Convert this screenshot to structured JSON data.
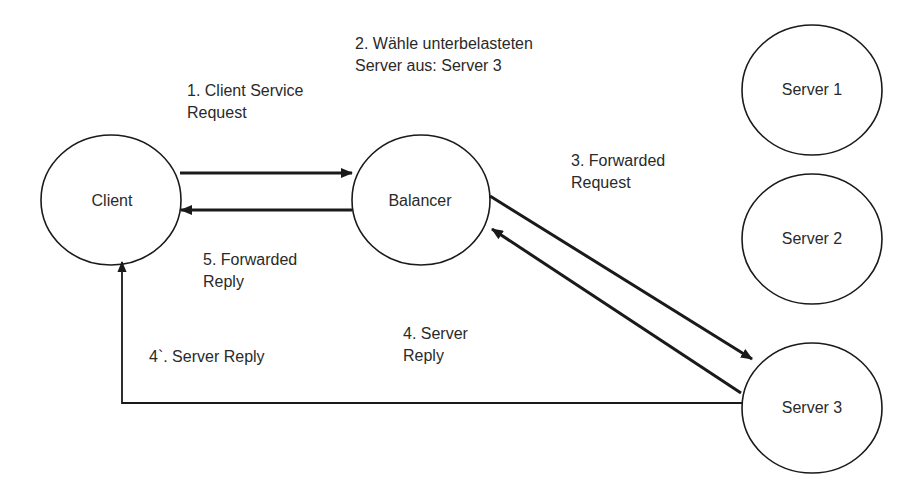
{
  "nodes": {
    "client": {
      "label": "Client"
    },
    "balancer": {
      "label": "Balancer"
    },
    "server1": {
      "label": "Server 1"
    },
    "server2": {
      "label": "Server 2"
    },
    "server3": {
      "label": "Server 3"
    }
  },
  "edges": {
    "step1": {
      "label": "1. Client Service\nRequest",
      "from": "Client",
      "to": "Balancer"
    },
    "step2": {
      "label": "2. Wähle unterbelasteten\nServer aus: Server 3"
    },
    "step3": {
      "label": "3. Forwarded\nRequest",
      "from": "Balancer",
      "to": "Server 3"
    },
    "step4": {
      "label": "4. Server\nReply",
      "from": "Server 3",
      "to": "Balancer"
    },
    "step4b": {
      "label": "4`. Server Reply",
      "from": "Server 3",
      "to": "Client"
    },
    "step5": {
      "label": "5. Forwarded\nReply",
      "from": "Balancer",
      "to": "Client"
    }
  },
  "colors": {
    "stroke": "#1a1a1a",
    "background": "#ffffff"
  }
}
